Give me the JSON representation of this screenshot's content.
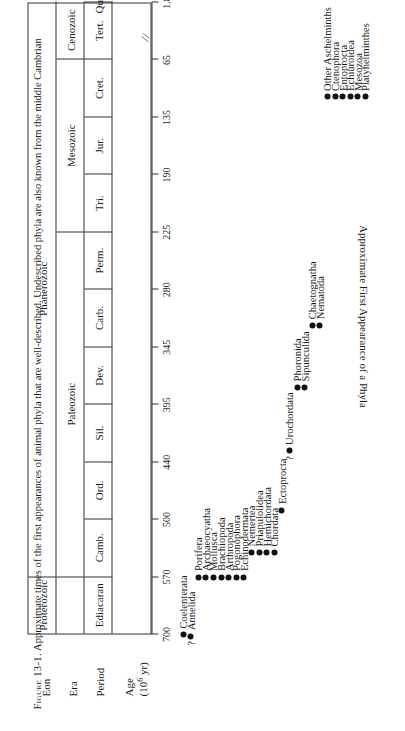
{
  "figure": {
    "number_label": "Figure 13-1.",
    "caption_text": "Approximate times of the first appearances of animal phyla that are well-described. Undescribed phyla are also known from the middle Cambrian",
    "y_axis_label": "Approximate First Appearance of a Phyla"
  },
  "row_labels": {
    "eon": "Eon",
    "era": "Era",
    "period": "Period",
    "age": "Age",
    "age_units": "(10",
    "age_units_exp": "6",
    "age_units_tail": " yr)"
  },
  "chart_data": {
    "type": "scatter",
    "title": "Approximate times of the first appearances of animal phyla",
    "xlabel": "Age (10^6 yr)",
    "ylabel": "Approximate First Appearance of a Phyla",
    "x_axis_direction": "oldest-left",
    "xlim": [
      700,
      0
    ],
    "grid": false,
    "legend": "none",
    "axis_break_after": "Tert.",
    "eons": [
      {
        "label": "Proterozoic",
        "start": 700,
        "end": 570
      },
      {
        "label": "Phanerozoic",
        "start": 570,
        "end": 0
      }
    ],
    "eras": [
      {
        "label": "",
        "start": 700,
        "end": 570
      },
      {
        "label": "Paleozoic",
        "start": 570,
        "end": 225
      },
      {
        "label": "Mesozoic",
        "start": 225,
        "end": 65
      },
      {
        "label": "Cenozoic",
        "start": 65,
        "end": 0
      }
    ],
    "periods": [
      {
        "label": "Ediacaran",
        "start": 700,
        "end": 570
      },
      {
        "label": "Camb.",
        "start": 570,
        "end": 500
      },
      {
        "label": "Ord.",
        "start": 500,
        "end": 440
      },
      {
        "label": "Sil.",
        "start": 440,
        "end": 395
      },
      {
        "label": "Dev.",
        "start": 395,
        "end": 345
      },
      {
        "label": "Carb.",
        "start": 345,
        "end": 280
      },
      {
        "label": "Perm.",
        "start": 280,
        "end": 225
      },
      {
        "label": "Tri.",
        "start": 225,
        "end": 190
      },
      {
        "label": "Jur.",
        "start": 190,
        "end": 135
      },
      {
        "label": "Cret.",
        "start": 135,
        "end": 65
      },
      {
        "label": "Tert.",
        "start": 65,
        "end": 1.8
      },
      {
        "label": "Quat.",
        "start": 1.8,
        "end": 0
      }
    ],
    "tick_labels": [
      "700",
      "570",
      "500",
      "440",
      "395",
      "345",
      "280",
      "225",
      "190",
      "135",
      "65",
      "1.8"
    ],
    "tick_values": [
      700,
      570,
      500,
      440,
      395,
      345,
      280,
      225,
      190,
      135,
      65,
      1.8
    ],
    "points": [
      {
        "name": "Coelenterata",
        "age": 700,
        "uncertain": false,
        "rank": 0
      },
      {
        "name": "Annelida",
        "age": 700,
        "uncertain": true,
        "rank": 1
      },
      {
        "name": "Porifera",
        "age": 570,
        "uncertain": false,
        "rank": 2
      },
      {
        "name": "Archaeocyatha",
        "age": 570,
        "uncertain": false,
        "rank": 3
      },
      {
        "name": "Mollusca",
        "age": 570,
        "uncertain": false,
        "rank": 4
      },
      {
        "name": "Brachiopoda",
        "age": 570,
        "uncertain": false,
        "rank": 5
      },
      {
        "name": "Arthropoda",
        "age": 570,
        "uncertain": false,
        "rank": 6
      },
      {
        "name": "Pogonophora",
        "age": 570,
        "uncertain": false,
        "rank": 7
      },
      {
        "name": "Echinodermata",
        "age": 570,
        "uncertain": false,
        "rank": 8
      },
      {
        "name": "Nemertea",
        "age": 540,
        "uncertain": false,
        "rank": 9
      },
      {
        "name": "Priapulolidea",
        "age": 540,
        "uncertain": false,
        "rank": 10
      },
      {
        "name": "Hemichordata",
        "age": 540,
        "uncertain": false,
        "rank": 11
      },
      {
        "name": "Chordata",
        "age": 540,
        "uncertain": false,
        "rank": 12
      },
      {
        "name": "Ectoprocta",
        "age": 490,
        "uncertain": false,
        "rank": 13
      },
      {
        "name": "Urochordata",
        "age": 430,
        "uncertain": true,
        "rank": 14
      },
      {
        "name": "Phoronida",
        "age": 380,
        "uncertain": false,
        "rank": 15
      },
      {
        "name": "Sipunculida",
        "age": 380,
        "uncertain": false,
        "rank": 16
      },
      {
        "name": "Chaetognatha",
        "age": 320,
        "uncertain": false,
        "rank": 17
      },
      {
        "name": "Nematoda",
        "age": 320,
        "uncertain": false,
        "rank": 18
      },
      {
        "name": "Other Aschelminths",
        "age": 110,
        "uncertain": false,
        "rank": 19
      },
      {
        "name": "Ctenophora",
        "age": 110,
        "uncertain": false,
        "rank": 20
      },
      {
        "name": "Entoprocta",
        "age": 110,
        "uncertain": false,
        "rank": 21
      },
      {
        "name": "Echiuroidea",
        "age": 110,
        "uncertain": false,
        "rank": 22
      },
      {
        "name": "Mesozoa",
        "age": 110,
        "uncertain": false,
        "rank": 23
      },
      {
        "name": "Platyhelminthes",
        "age": 110,
        "uncertain": false,
        "rank": 24
      }
    ]
  }
}
